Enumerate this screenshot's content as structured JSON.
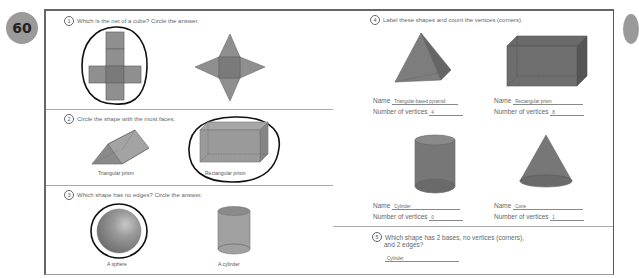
{
  "page": {
    "number": "60"
  },
  "colors": {
    "shape_fill": "#8f8f8f",
    "shape_dark": "#6e6e6e",
    "badge": "#9a9a9a",
    "frame": "#666666"
  },
  "q1": {
    "num": "1",
    "text": "Which is the net of a cube? Circle the answer.",
    "options": [
      {
        "shape": "cross-net",
        "circled": true
      },
      {
        "shape": "star-net",
        "circled": false
      }
    ]
  },
  "q2": {
    "num": "2",
    "text": "Circle the shape with the most faces.",
    "options": [
      {
        "caption": "Triangular prism",
        "circled": false
      },
      {
        "caption": "Rectangular prism",
        "circled": true
      }
    ]
  },
  "q3": {
    "num": "3",
    "text": "Which shape has no edges? Circle the answer.",
    "options": [
      {
        "caption": "A sphere",
        "circled": true
      },
      {
        "caption": "A cylinder",
        "circled": false
      }
    ]
  },
  "q4": {
    "num": "4",
    "text": "Label these shapes and count the vertices (corners).",
    "name_label": "Name",
    "vertices_label": "Number of vertices",
    "items": [
      {
        "shape": "pyramid",
        "name": "Triangular-based pyramid",
        "vertices": "4"
      },
      {
        "shape": "box",
        "name": "Rectangular prism",
        "vertices": "8"
      },
      {
        "shape": "cylinder",
        "name": "Cylinder",
        "vertices": "0"
      },
      {
        "shape": "cone",
        "name": "Cone",
        "vertices": "1"
      }
    ]
  },
  "q5": {
    "num": "5",
    "text_line1": "Which shape has 2 bases, no vertices (corners),",
    "text_line2": "and 2 edges?",
    "answer": "Cylinder"
  }
}
